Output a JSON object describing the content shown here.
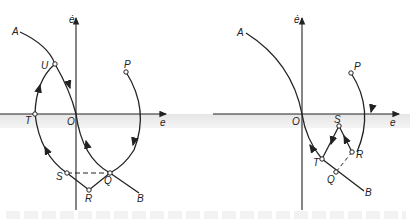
{
  "figure": {
    "left_panel": {
      "axis_x_label": "e",
      "axis_y_label": "ė",
      "origin_label": "O",
      "points": [
        "A",
        "U",
        "T",
        "S",
        "R",
        "Q",
        "B",
        "P"
      ]
    },
    "right_panel": {
      "axis_x_label": "e",
      "axis_y_label": "ė",
      "origin_label": "O",
      "points": [
        "A",
        "P",
        "S",
        "R",
        "T",
        "Q",
        "B"
      ]
    },
    "caption": ""
  }
}
